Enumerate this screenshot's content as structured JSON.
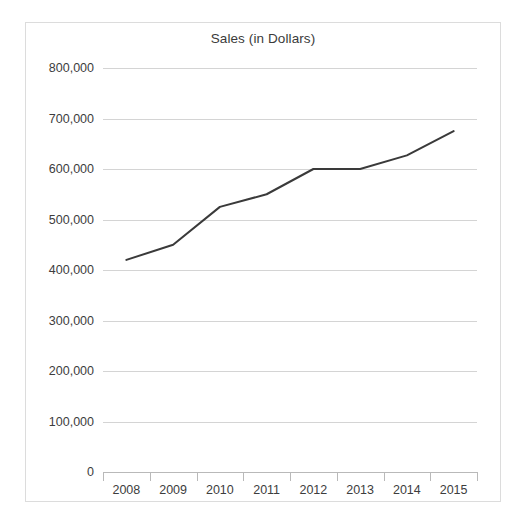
{
  "chart_data": {
    "type": "line",
    "title": "Sales (in Dollars)",
    "xlabel": "",
    "ylabel": "",
    "categories": [
      "2008",
      "2009",
      "2010",
      "2011",
      "2012",
      "2013",
      "2014",
      "2015"
    ],
    "values": [
      420000,
      450000,
      525000,
      550000,
      600000,
      600000,
      627000,
      675000
    ],
    "series": [
      {
        "name": "Sales",
        "values": [
          420000,
          450000,
          525000,
          550000,
          600000,
          600000,
          627000,
          675000
        ]
      }
    ],
    "ylim": [
      0,
      800000
    ],
    "ytick_values": [
      0,
      100000,
      200000,
      300000,
      400000,
      500000,
      600000,
      700000,
      800000
    ],
    "ytick_labels": [
      "0",
      "100,000",
      "200,000",
      "300,000",
      "400,000",
      "500,000",
      "600,000",
      "700,000",
      "800,000"
    ],
    "xtick_labels": [
      "2008",
      "2009",
      "2010",
      "2011",
      "2012",
      "2013",
      "2014",
      "2015"
    ],
    "grid": true,
    "legend": false,
    "legend_position": "none",
    "line_color": "#3a3a3a",
    "grid_color": "#d4d4d4",
    "axis_color": "#b9b9b9",
    "border_color": "#dcdcdc",
    "background_color": "#ffffff",
    "text_color": "#3d3d3d"
  }
}
